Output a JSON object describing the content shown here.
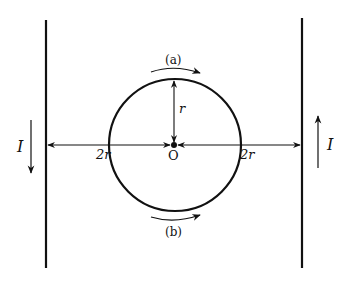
{
  "diagram": {
    "colors": {
      "stroke": "#111111",
      "background": "#ffffff"
    },
    "left_wire": {
      "current_label": "I",
      "current_direction": "down"
    },
    "right_wire": {
      "current_label": "I",
      "current_direction": "up"
    },
    "loop": {
      "center_label": "O",
      "radius_label": "r",
      "top_label": "(a)",
      "bottom_label": "(b)",
      "top_arrow_direction": "clockwise",
      "bottom_arrow_direction": "counterclockwise"
    },
    "distances": {
      "left_label": "2r",
      "right_label": "2r"
    }
  }
}
